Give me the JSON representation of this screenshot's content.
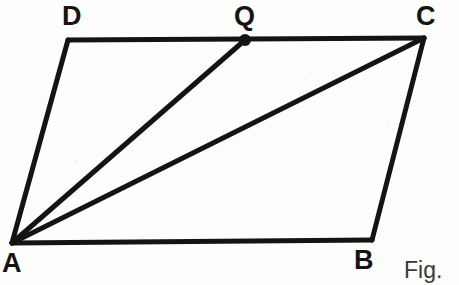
{
  "figure": {
    "caption": "Fig.",
    "background_color": "#fdfdfb",
    "stroke_color": "#141414",
    "stroke_width": 5,
    "canvas": {
      "width": 459,
      "height": 285
    }
  },
  "labels": {
    "A": "A",
    "B": "B",
    "C": "C",
    "D": "D",
    "Q": "Q"
  },
  "chart_data": {
    "type": "diagram",
    "title": "Fig.",
    "shape": "parallelogram ABCD with diagonal AC and cevian AQ",
    "points": [
      {
        "name": "A",
        "x": 12,
        "y": 243,
        "label_position": "below-left",
        "marker": "none"
      },
      {
        "name": "B",
        "x": 372,
        "y": 240,
        "label_position": "below",
        "marker": "none"
      },
      {
        "name": "C",
        "x": 424,
        "y": 38,
        "label_position": "above",
        "marker": "none"
      },
      {
        "name": "D",
        "x": 68,
        "y": 40,
        "label_position": "above",
        "marker": "none"
      },
      {
        "name": "Q",
        "x": 245,
        "y": 40,
        "label_position": "above",
        "marker": "filled-dot"
      }
    ],
    "segments": [
      {
        "name": "AB",
        "from": "A",
        "to": "B",
        "style": "solid"
      },
      {
        "name": "BC",
        "from": "B",
        "to": "C",
        "style": "solid"
      },
      {
        "name": "CD",
        "from": "C",
        "to": "D",
        "style": "solid"
      },
      {
        "name": "DA",
        "from": "D",
        "to": "A",
        "style": "solid"
      },
      {
        "name": "AC",
        "from": "A",
        "to": "C",
        "style": "solid"
      },
      {
        "name": "AQ",
        "from": "A",
        "to": "Q",
        "style": "solid"
      }
    ],
    "marker_radius": 6,
    "xlim": [
      0,
      459
    ],
    "ylim": [
      285,
      0
    ],
    "grid": false,
    "legend": false
  }
}
